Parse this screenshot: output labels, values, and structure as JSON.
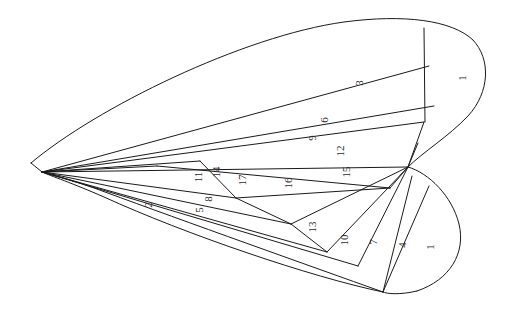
{
  "figure": {
    "kind": "sector-partition-diagram",
    "shape_name": "butterfly-wing-outline",
    "width": 520,
    "height": 317,
    "background_color": "#ffffff",
    "stroke_color": "#1a1a1a",
    "label_color": "#2b2b2b",
    "stroke_width": 1,
    "label_rotation_deg": -90,
    "label_font_size": 11
  },
  "chart_data": {
    "type": "diagram",
    "title": "",
    "subtitle": "",
    "xlabel": "",
    "ylabel": "",
    "grid": false,
    "legend": false,
    "categories": [
      "1",
      "2",
      "3",
      "4",
      "5",
      "6",
      "7",
      "8",
      "9",
      "10",
      "11",
      "12",
      "13",
      "14",
      "15",
      "16",
      "17"
    ],
    "values": [
      1,
      2,
      3,
      4,
      5,
      6,
      7,
      8,
      9,
      10,
      11,
      12,
      13,
      14,
      15,
      16,
      17
    ],
    "label_count": 18,
    "distinct_label_count": 17,
    "repeated_labels": [
      "1"
    ]
  },
  "labels": [
    {
      "id": "label-1-upper",
      "text": "1",
      "x": 463,
      "y": 78,
      "lobe": "upper-right"
    },
    {
      "id": "label-3",
      "text": "3",
      "x": 360,
      "y": 83,
      "lobe": "upper"
    },
    {
      "id": "label-6",
      "text": "6",
      "x": 325,
      "y": 120,
      "lobe": "upper"
    },
    {
      "id": "label-9",
      "text": "9",
      "x": 313,
      "y": 138,
      "lobe": "upper"
    },
    {
      "id": "label-12",
      "text": "12",
      "x": 341,
      "y": 151,
      "lobe": "middle"
    },
    {
      "id": "label-15",
      "text": "15",
      "x": 347,
      "y": 172,
      "lobe": "middle"
    },
    {
      "id": "label-16",
      "text": "16",
      "x": 289,
      "y": 183,
      "lobe": "middle"
    },
    {
      "id": "label-17",
      "text": "17",
      "x": 243,
      "y": 180,
      "lobe": "middle"
    },
    {
      "id": "label-14",
      "text": "14",
      "x": 217,
      "y": 172,
      "lobe": "middle"
    },
    {
      "id": "label-11",
      "text": "11",
      "x": 199,
      "y": 177,
      "lobe": "middle"
    },
    {
      "id": "label-8",
      "text": "8",
      "x": 209,
      "y": 199,
      "lobe": "lower"
    },
    {
      "id": "label-5",
      "text": "5",
      "x": 200,
      "y": 210,
      "lobe": "lower"
    },
    {
      "id": "label-2",
      "text": "2",
      "x": 149,
      "y": 205,
      "lobe": "lower"
    },
    {
      "id": "label-13",
      "text": "13",
      "x": 313,
      "y": 227,
      "lobe": "lower"
    },
    {
      "id": "label-10",
      "text": "10",
      "x": 345,
      "y": 240,
      "lobe": "lower-right"
    },
    {
      "id": "label-7",
      "text": "7",
      "x": 374,
      "y": 242,
      "lobe": "lower-right"
    },
    {
      "id": "label-4",
      "text": "4",
      "x": 403,
      "y": 245,
      "lobe": "lower-right"
    },
    {
      "id": "label-1-lower",
      "text": "1",
      "x": 431,
      "y": 247,
      "lobe": "lower-right"
    }
  ],
  "outline_paths": [
    {
      "id": "upper-lobe-top-curve",
      "name": "upper-wing-top-boundary",
      "d": "M 31 163 C 96 108 243 36 344 22 C 404 14 452 20 473 40"
    },
    {
      "id": "upper-lobe-right-curve",
      "name": "upper-wing-right-boundary",
      "d": "M 473 40 C 491 59 490 92 468 116 C 448 137 423 152 408 167"
    },
    {
      "id": "lower-lobe-right-curve",
      "name": "lower-wing-right-boundary",
      "d": "M 408 167 C 429 173 452 196 459 224 C 466 253 450 280 417 291"
    },
    {
      "id": "lower-lobe-bottom-curve",
      "name": "lower-wing-bottom-boundary",
      "d": "M 417 291 C 400 295 387 294 383 292"
    },
    {
      "id": "lower-outer-bottom-curve",
      "name": "lower-wing-outer-bottom-boundary",
      "d": "M 383 292 C 311 277 185 234 104 197 C 72 183 51 176 42 172"
    },
    {
      "id": "lower-inner-bottom-curve",
      "name": "lower-wing-inner-bottom-boundary",
      "d": "M 383 292 C 310 266 184 221 105 192 C 73 180 52 175 42 172"
    },
    {
      "id": "left-apex-link",
      "name": "left-apex-connector",
      "d": "M 31 163 L 42 172"
    }
  ],
  "chord_paths": [
    {
      "id": "chord-a",
      "name": "chord-upper-1-3",
      "d": "M 424 28 L 425 122"
    },
    {
      "id": "chord-b",
      "name": "chord-3-6",
      "d": "M 42 172 L 429 66"
    },
    {
      "id": "chord-c",
      "name": "chord-6-9",
      "d": "M 42 172 L 434 106"
    },
    {
      "id": "chord-d",
      "name": "chord-9-12",
      "d": "M 42 172 L 424 122"
    },
    {
      "id": "chord-e",
      "name": "chord-12-15",
      "d": "M 42 172 L 408 167"
    },
    {
      "id": "chord-f",
      "name": "chord-15-16",
      "d": "M 390 188 L 408 167"
    },
    {
      "id": "chord-g",
      "name": "chord-16-upper",
      "d": "M 157 166 L 390 188"
    },
    {
      "id": "chord-h",
      "name": "chord-16-lower",
      "d": "M 236 198 L 390 188"
    },
    {
      "id": "chord-i",
      "name": "chord-17-left",
      "d": "M 200 161 L 236 198"
    },
    {
      "id": "chord-j",
      "name": "chord-17-right",
      "d": "M 236 198 L 291 224"
    },
    {
      "id": "chord-k",
      "name": "chord-13-right",
      "d": "M 291 224 L 408 167"
    },
    {
      "id": "chord-l",
      "name": "chord-13-bottom",
      "d": "M 291 224 L 327 252"
    },
    {
      "id": "chord-m",
      "name": "chord-10",
      "d": "M 327 252 L 408 167"
    },
    {
      "id": "chord-n",
      "name": "chord-7",
      "d": "M 358 266 L 408 167"
    },
    {
      "id": "chord-o",
      "name": "chord-4",
      "d": "M 383 292 L 412 176"
    },
    {
      "id": "chord-p",
      "name": "chord-1-lower",
      "d": "M 383 292 L 429 186"
    },
    {
      "id": "chord-q",
      "name": "chord-11",
      "d": "M 42 172 L 200 161"
    },
    {
      "id": "chord-r",
      "name": "chord-14",
      "d": "M 42 172 L 236 198"
    },
    {
      "id": "chord-s",
      "name": "chord-8",
      "d": "M 42 172 L 291 224"
    },
    {
      "id": "chord-t",
      "name": "chord-5",
      "d": "M 42 172 L 327 252"
    },
    {
      "id": "chord-u",
      "name": "chord-2",
      "d": "M 42 172 L 358 266"
    },
    {
      "id": "chord-v",
      "name": "chord-apex-upper",
      "d": "M 42 172 L 157 166"
    },
    {
      "id": "chord-w",
      "name": "chord-hub-spur",
      "d": "M 408 167 L 418 143"
    },
    {
      "id": "chord-x",
      "name": "chord-hub-spur-2",
      "d": "M 408 167 L 424 122"
    }
  ]
}
